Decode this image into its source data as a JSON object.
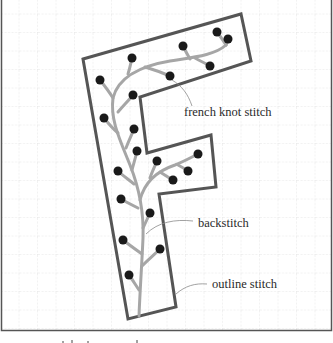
{
  "figure": {
    "labels": {
      "french_knot": "french knot stitch",
      "backstitch": "backstitch",
      "outline": "outline stitch"
    },
    "colors": {
      "outline": "#555555",
      "backstitch": "#a6a6a6",
      "knot": "#1a1a1a",
      "grid": "#e2e2e2",
      "frame": "#555555",
      "leader": "#8a8a8a",
      "text": "#2a2a2a"
    },
    "grid_spacing_px": 18.5,
    "knot_count": 21
  }
}
